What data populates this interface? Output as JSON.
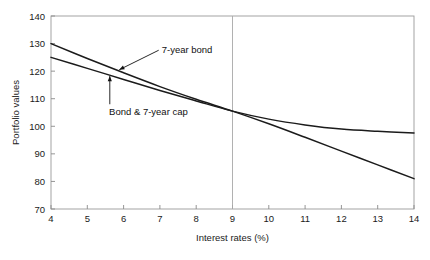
{
  "chart_data": {
    "type": "line",
    "title": "",
    "xlabel": "Interest rates (%)",
    "ylabel": "Portfolio values",
    "xlim": [
      4,
      14
    ],
    "ylim": [
      70,
      140
    ],
    "xticks": [
      4,
      5,
      6,
      7,
      8,
      9,
      10,
      11,
      12,
      13,
      14
    ],
    "xtick_labels": [
      "4",
      "5",
      "6",
      "7",
      "8",
      "9",
      "10",
      "11",
      "12",
      "13",
      "14"
    ],
    "yticks": [
      70,
      80,
      90,
      100,
      110,
      120,
      130,
      140
    ],
    "ytick_labels": [
      "70",
      "80",
      "90",
      "100",
      "110",
      "120",
      "130",
      "140"
    ],
    "grid": false,
    "legend_position": "inline-annotations",
    "reference_lines": [
      {
        "name": "crossover-vline",
        "axis": "x",
        "value": 9
      }
    ],
    "series": [
      {
        "name": "7-year bond",
        "color": "#1b1b1b",
        "x": [
          4,
          5,
          6,
          7,
          8,
          9,
          10,
          11,
          12,
          13,
          14
        ],
        "values": [
          130.0,
          124.6,
          119.4,
          114.4,
          109.8,
          105.5,
          100.9,
          96.0,
          91.0,
          86.0,
          81.0
        ]
      },
      {
        "name": "Bond & 7-year cap",
        "color": "#1b1b1b",
        "x": [
          4,
          5,
          6,
          7,
          8,
          9,
          10,
          11,
          12,
          13,
          14
        ],
        "values": [
          125.0,
          121.0,
          117.0,
          113.0,
          109.2,
          105.5,
          102.6,
          100.5,
          99.0,
          98.2,
          97.6
        ]
      }
    ],
    "annotations": [
      {
        "name": "7-year-bond-annotation",
        "text": "7-year bond",
        "text_x": 7.05,
        "text_y": 126.5,
        "arrow_tip_x": 5.88,
        "arrow_tip_y": 120.5
      },
      {
        "name": "bond-and-cap-annotation",
        "text": "Bond & 7-year cap",
        "text_x": 5.6,
        "text_y": 104.0,
        "arrow_tip_x": 5.62,
        "arrow_tip_y": 118.2
      }
    ]
  },
  "plot_geometry": {
    "left_px": 51,
    "right_px": 414,
    "top_px": 16,
    "bottom_px": 209
  },
  "colors": {
    "background": "#ffffff",
    "curve": "#1b1b1b",
    "frame": "#9a9a9a",
    "text": "#1a1a1a"
  }
}
